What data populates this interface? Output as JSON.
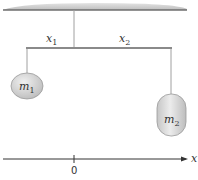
{
  "figure": {
    "ceiling": {
      "color": "#c8c8c8",
      "edge_color": "#6e6e6e"
    },
    "bar": {
      "color": "#8a8a8a"
    },
    "strings": {
      "color": "#a0a0a0"
    },
    "labels": {
      "x1_main": "x",
      "x1_sub": "1",
      "x2_main": "x",
      "x2_sub": "2"
    },
    "masses": [
      {
        "id": "m1",
        "main": "m",
        "sub": "1",
        "shape": "ellipse",
        "fill": "#d4d4d4"
      },
      {
        "id": "m2",
        "main": "m",
        "sub": "2",
        "shape": "capsule",
        "fill": "#d4d4d4"
      }
    ],
    "axis": {
      "label": "x",
      "origin_label": "0",
      "color": "#333333"
    }
  }
}
